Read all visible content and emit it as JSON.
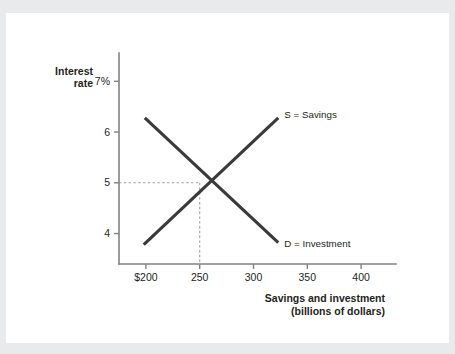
{
  "figure": {
    "background_color": "#e9eaec",
    "card_color": "#ffffff",
    "axis_color": "#808285",
    "curve_color": "#3a3a3c",
    "guide_color": "#9d9fa2"
  },
  "chart_data": {
    "type": "line",
    "title": "",
    "subtitle": "",
    "xlabel": "Savings and investment",
    "xlabel_sub": "(billions of dollars)",
    "ylabel": "Interest",
    "ylabel_line2": "rate",
    "grid": false,
    "legend_position": "inline-at-curve-end",
    "xlim": [
      175,
      425
    ],
    "ylim": [
      3.4,
      7.4
    ],
    "xticks": [
      200,
      250,
      300,
      350,
      400
    ],
    "xtick_labels": [
      "$200",
      "250",
      "300",
      "350",
      "400"
    ],
    "yticks": [
      7,
      6,
      5,
      4
    ],
    "ytick_labels": [
      "7%",
      "6",
      "5",
      "4"
    ],
    "equilibrium": {
      "x": 250,
      "y": 5,
      "label": ""
    },
    "guides": [
      {
        "name": "equilibrium-horizontal",
        "from": [
          175,
          5
        ],
        "to": [
          250,
          5
        ]
      },
      {
        "name": "equilibrium-vertical",
        "from": [
          250,
          5
        ],
        "to": [
          250,
          3.4
        ]
      }
    ],
    "series": [
      {
        "name": "S = Savings",
        "label": "S = Savings",
        "slope": "upward",
        "points": [
          [
            198,
            3.78
          ],
          [
            323,
            6.28
          ]
        ]
      },
      {
        "name": "D = Investment",
        "label": "D = Investment",
        "slope": "downward",
        "points": [
          [
            199,
            6.28
          ],
          [
            323,
            3.82
          ]
        ]
      }
    ]
  }
}
